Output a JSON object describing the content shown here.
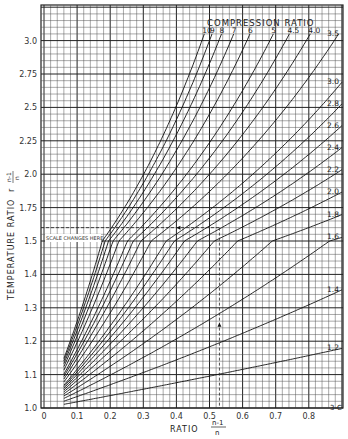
{
  "chart_data": {
    "type": "line",
    "title": "COMPRESSION RATIO",
    "xlabel": "RATIO (n-1)/n",
    "ylabel": "TEMPERATURE RATIO r^((n-1)/n)",
    "xlim": [
      0,
      0.9
    ],
    "ylim": [
      1.0,
      3.2
    ],
    "x_ticks": [
      "0",
      "0.1",
      "0.2",
      "0.3",
      "0.4",
      "0.5",
      "0.6",
      "0.7",
      "0.8"
    ],
    "y_ticks": [
      "1.0",
      "1.1",
      "1.2",
      "1.3",
      "1.4",
      "1.5",
      "1.75",
      "2.0",
      "2.25",
      "2.5",
      "2.75",
      "3.0"
    ],
    "grid": true,
    "annotation": "SCALE CHANGES HERE",
    "scale_change_at": 1.5,
    "example_path": {
      "y": 1.6,
      "x": 0.53
    },
    "corner_label": "3-C",
    "top_labels": [
      "10",
      "9",
      "8",
      "7",
      "6",
      "5",
      "4.5",
      "4.0"
    ],
    "right_labels": [
      "3.5",
      "3.0",
      "2.8",
      "2.6",
      "2.4",
      "2.2",
      "2.0",
      "1.8",
      "1.6",
      "1.4",
      "1.2"
    ],
    "series": [
      {
        "name": "10",
        "ratio": 10
      },
      {
        "name": "9",
        "ratio": 9
      },
      {
        "name": "8",
        "ratio": 8
      },
      {
        "name": "7",
        "ratio": 7
      },
      {
        "name": "6",
        "ratio": 6
      },
      {
        "name": "5",
        "ratio": 5
      },
      {
        "name": "4.5",
        "ratio": 4.5
      },
      {
        "name": "4.0",
        "ratio": 4.0
      },
      {
        "name": "3.5",
        "ratio": 3.5
      },
      {
        "name": "3.0",
        "ratio": 3.0
      },
      {
        "name": "2.8",
        "ratio": 2.8
      },
      {
        "name": "2.6",
        "ratio": 2.6
      },
      {
        "name": "2.4",
        "ratio": 2.4
      },
      {
        "name": "2.2",
        "ratio": 2.2
      },
      {
        "name": "2.0",
        "ratio": 2.0
      },
      {
        "name": "1.8",
        "ratio": 1.8
      },
      {
        "name": "1.6",
        "ratio": 1.6
      },
      {
        "name": "1.4",
        "ratio": 1.4
      },
      {
        "name": "1.2",
        "ratio": 1.2
      }
    ],
    "x_start": 0.06
  },
  "labels": {
    "title": "COMPRESSION RATIO",
    "xlabel": "RATIO",
    "xfrac_num": "n-1",
    "xfrac_den": "n",
    "ylabel": "TEMPERATURE RATIO",
    "yexp_base": "r",
    "yfrac_num": "n-1",
    "yfrac_den": "n",
    "annotation": "SCALE CHANGES HERE",
    "corner": "3-C"
  }
}
